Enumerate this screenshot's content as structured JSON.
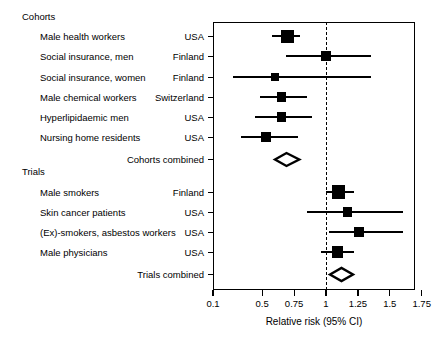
{
  "figure": {
    "type": "forest-plot",
    "axis_title": "Relative risk (95% CI)",
    "reference_value": 1
  },
  "groups": [
    {
      "label": "Cohorts"
    },
    {
      "label": "Trials"
    }
  ],
  "summaries": [
    {
      "label": "Cohorts combined"
    },
    {
      "label": "Trials combined"
    }
  ],
  "xaxis": {
    "ticks": [
      {
        "label": "0.1",
        "value": 0.1
      },
      {
        "label": "0.5",
        "value": 0.5
      },
      {
        "label": "0.75",
        "value": 0.75
      },
      {
        "label": "1",
        "value": 1
      },
      {
        "label": "1.25",
        "value": 1.25
      },
      {
        "label": "1.5",
        "value": 1.5
      },
      {
        "label": "1.75",
        "value": 1.75
      }
    ],
    "min": 0.1,
    "max": 1.75
  },
  "chart_data": {
    "type": "forest",
    "title": "",
    "xlabel": "Relative risk (95% CI)",
    "ylabel": "",
    "xlim": [
      0.1,
      1.75
    ],
    "xticks": [
      0.1,
      0.5,
      0.75,
      1,
      1.25,
      1.5,
      1.75
    ],
    "reference_line": 1,
    "grid": false,
    "legend": "none",
    "groups": [
      {
        "name": "Cohorts",
        "rows": [
          {
            "study": "Male health workers",
            "country": "USA",
            "rr": 0.7,
            "lo": 0.58,
            "hi": 0.8,
            "weight": 1.0
          },
          {
            "study": "Social insurance, men",
            "country": "Finland",
            "rr": 1.0,
            "lo": 0.69,
            "hi": 1.35,
            "weight": 0.45
          },
          {
            "study": "Social insurance, women",
            "country": "Finland",
            "rr": 0.6,
            "lo": 0.26,
            "hi": 1.35,
            "weight": 0.4
          },
          {
            "study": "Male chemical workers",
            "country": "Switzerland",
            "rr": 0.65,
            "lo": 0.48,
            "hi": 0.85,
            "weight": 0.52
          },
          {
            "study": "Hyperlipidaemic men",
            "country": "USA",
            "rr": 0.65,
            "lo": 0.44,
            "hi": 0.89,
            "weight": 0.52
          },
          {
            "study": "Nursing home residents",
            "country": "USA",
            "rr": 0.53,
            "lo": 0.33,
            "hi": 0.78,
            "weight": 0.45
          }
        ],
        "summary": {
          "label": "Cohorts combined",
          "rr": 0.69,
          "lo": 0.6,
          "hi": 0.79
        }
      },
      {
        "name": "Trials",
        "rows": [
          {
            "study": "Male smokers",
            "country": "Finland",
            "rr": 1.1,
            "lo": 1.0,
            "hi": 1.22,
            "weight": 1.05
          },
          {
            "study": "Skin cancer patients",
            "country": "USA",
            "rr": 1.17,
            "lo": 0.85,
            "hi": 1.6,
            "weight": 0.5
          },
          {
            "study": "(Ex)-smokers, asbestos workers",
            "country": "USA",
            "rr": 1.26,
            "lo": 1.02,
            "hi": 1.6,
            "weight": 0.55
          },
          {
            "study": "Male physicians",
            "country": "USA",
            "rr": 1.09,
            "lo": 0.96,
            "hi": 1.22,
            "weight": 0.75
          }
        ],
        "summary": {
          "label": "Trials combined",
          "rr": 1.12,
          "lo": 1.03,
          "hi": 1.21
        }
      }
    ]
  }
}
